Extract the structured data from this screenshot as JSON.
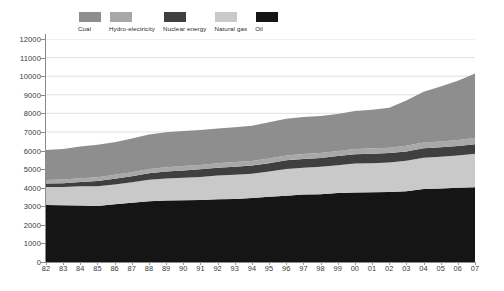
{
  "legend": {
    "position": "top-left",
    "items": [
      {
        "label": "Coal",
        "color": "#8e8e8e",
        "key": "coal"
      },
      {
        "label": "Hydro-electricity",
        "color": "#a8a8a8",
        "key": "hydro"
      },
      {
        "label": "Nuclear energy",
        "color": "#3f3f3f",
        "key": "nuclear"
      },
      {
        "label": "Natural gas",
        "color": "#c9c9c9",
        "key": "gas"
      },
      {
        "label": "Oil",
        "color": "#151515",
        "key": "oil"
      }
    ]
  },
  "axes": {
    "y_ticks": [
      0,
      1000,
      2000,
      3000,
      4000,
      5000,
      6000,
      7000,
      8000,
      9000,
      10000,
      11000,
      12000
    ],
    "y_tick_labels": [
      "0",
      "1000",
      "2000",
      "3000",
      "4000",
      "5000",
      "6000",
      "7000",
      "8000",
      "9000",
      "10000",
      "11000",
      "12000"
    ],
    "x_tick_labels": [
      "82",
      "83",
      "84",
      "85",
      "86",
      "87",
      "88",
      "89",
      "90",
      "91",
      "92",
      "93",
      "94",
      "95",
      "96",
      "97",
      "98",
      "99",
      "00",
      "01",
      "02",
      "03",
      "04",
      "05",
      "06",
      "07"
    ]
  },
  "chart_data": {
    "type": "area",
    "stacked": true,
    "title": "",
    "subtitle": "",
    "xlabel": "",
    "ylabel": "",
    "ylim": [
      0,
      12000
    ],
    "grid": true,
    "grid_axis": "y",
    "legend_position": "top-left",
    "stack_order_bottom_to_top": [
      "Oil",
      "Natural gas",
      "Nuclear energy",
      "Hydro-electricity",
      "Coal"
    ],
    "categories": [
      "82",
      "83",
      "84",
      "85",
      "86",
      "87",
      "88",
      "89",
      "90",
      "91",
      "92",
      "93",
      "94",
      "95",
      "96",
      "97",
      "98",
      "99",
      "00",
      "01",
      "02",
      "03",
      "04",
      "05",
      "06",
      "07"
    ],
    "series": [
      {
        "name": "Oil",
        "color": "#151515",
        "values": [
          3070,
          3060,
          3040,
          3020,
          3110,
          3190,
          3270,
          3310,
          3320,
          3330,
          3380,
          3390,
          3440,
          3510,
          3570,
          3630,
          3650,
          3710,
          3740,
          3750,
          3770,
          3810,
          3930,
          3960,
          3990,
          4020
        ]
      },
      {
        "name": "Natural gas",
        "color": "#c9c9c9",
        "values": [
          970,
          980,
          1030,
          1050,
          1060,
          1100,
          1150,
          1190,
          1220,
          1250,
          1280,
          1310,
          1310,
          1360,
          1430,
          1440,
          1470,
          1500,
          1560,
          1570,
          1590,
          1640,
          1680,
          1700,
          1740,
          1800
        ]
      },
      {
        "name": "Nuclear energy",
        "color": "#3f3f3f",
        "values": [
          180,
          200,
          240,
          290,
          310,
          330,
          360,
          370,
          390,
          410,
          410,
          430,
          440,
          450,
          470,
          470,
          480,
          490,
          500,
          500,
          500,
          500,
          510,
          510,
          510,
          510
        ]
      },
      {
        "name": "Hydro-electricity",
        "color": "#a8a8a8",
        "values": [
          190,
          195,
          200,
          205,
          210,
          215,
          220,
          225,
          230,
          235,
          240,
          245,
          250,
          255,
          260,
          265,
          270,
          275,
          280,
          285,
          290,
          300,
          310,
          320,
          330,
          340
        ]
      },
      {
        "name": "Coal",
        "color": "#8e8e8e",
        "values": [
          1620,
          1650,
          1700,
          1740,
          1760,
          1810,
          1860,
          1890,
          1890,
          1880,
          1880,
          1880,
          1890,
          1940,
          1980,
          2000,
          1990,
          1990,
          2050,
          2090,
          2150,
          2440,
          2730,
          2950,
          3190,
          3480
        ]
      }
    ],
    "totals": [
      6030,
      6085,
      6210,
      6305,
      6450,
      6645,
      6860,
      6985,
      7050,
      7105,
      7190,
      7255,
      7330,
      7515,
      7710,
      7805,
      7860,
      7965,
      8130,
      8195,
      8300,
      8690,
      9160,
      9440,
      9760,
      10150
    ]
  }
}
